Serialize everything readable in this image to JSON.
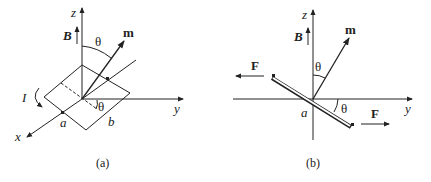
{
  "figure": {
    "panels": [
      {
        "id": "a",
        "caption": "(a)",
        "labels": {
          "z_axis": "z",
          "y_axis": "y",
          "x_axis": "x",
          "field": "B",
          "moment": "m",
          "angle_top": "θ",
          "angle_bottom": "θ",
          "current": "I",
          "side_a": "a",
          "side_b": "b"
        }
      },
      {
        "id": "b",
        "caption": "(b)",
        "labels": {
          "z_axis": "z",
          "y_axis": "y",
          "field": "B",
          "moment": "m",
          "angle_top": "θ",
          "angle_bottom": "θ",
          "side_a": "a",
          "force_left": "F",
          "force_right": "F"
        }
      }
    ]
  }
}
